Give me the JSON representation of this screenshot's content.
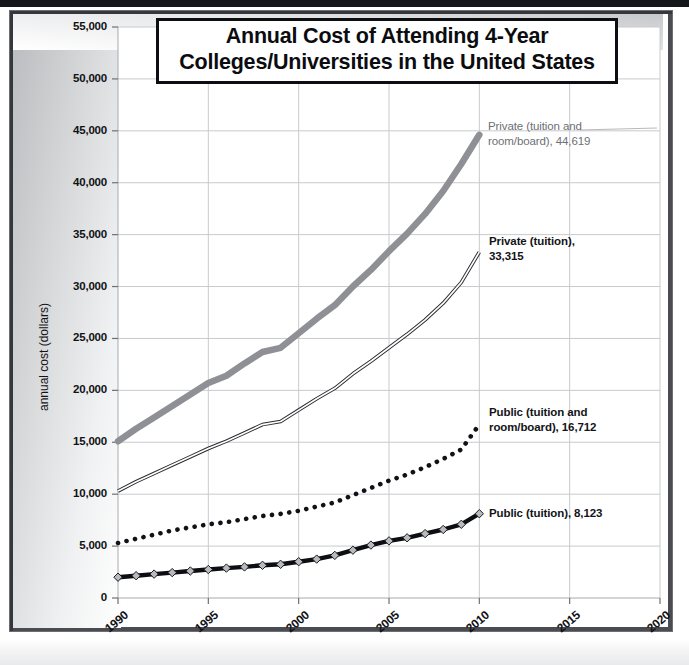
{
  "chart_data": {
    "type": "line",
    "title": "Annual Cost of Attending 4-Year Colleges/Universities in the United States",
    "title_lines": [
      "Annual Cost of Attending 4-Year",
      "Colleges/Universities in the United States"
    ],
    "xlabel": "",
    "ylabel": "annual cost (dollars)",
    "xlim": [
      1990,
      2020
    ],
    "ylim": [
      0,
      55000
    ],
    "xticks": [
      1990,
      1995,
      2000,
      2005,
      2010,
      2015,
      2020
    ],
    "xtick_labels": [
      "1990",
      "1995",
      "2000",
      "2005",
      "2010",
      "2015",
      "2020"
    ],
    "yticks": [
      0,
      5000,
      10000,
      15000,
      20000,
      25000,
      30000,
      35000,
      40000,
      45000,
      50000,
      55000
    ],
    "ytick_labels": [
      "0",
      "5,000",
      "10,000",
      "15,000",
      "20,000",
      "25,000",
      "30,000",
      "35,000",
      "40,000",
      "45,000",
      "50,000",
      "55,000"
    ],
    "grid": true,
    "legend_position": "inline-annotations",
    "x": [
      1990,
      1991,
      1992,
      1993,
      1994,
      1995,
      1996,
      1997,
      1998,
      1999,
      2000,
      2001,
      2002,
      2003,
      2004,
      2005,
      2006,
      2007,
      2008,
      2009,
      2010
    ],
    "series": [
      {
        "name": "Private (tuition and room/board)",
        "style": "thick-gray-line",
        "color": "#8e9095",
        "end_label": "Private (tuition and\nroom/board), 44,619",
        "end_value": 44619,
        "values": [
          15100,
          16300,
          17400,
          18500,
          19600,
          20700,
          21400,
          22600,
          23700,
          24100,
          25500,
          26900,
          28200,
          30000,
          31600,
          33400,
          35100,
          37000,
          39200,
          41800,
          44619
        ]
      },
      {
        "name": "Private (tuition)",
        "style": "thin-double-line",
        "color": "#2b2c30",
        "end_label": "Private (tuition),\n     33,315",
        "end_value": 33315,
        "values": [
          10300,
          11200,
          12000,
          12800,
          13600,
          14400,
          15100,
          15900,
          16700,
          17000,
          18100,
          19200,
          20200,
          21600,
          22800,
          24100,
          25400,
          26800,
          28400,
          30400,
          33315
        ]
      },
      {
        "name": "Public (tuition and room/board)",
        "style": "dotted-line",
        "color": "#111215",
        "end_label": "Public (tuition and\nroom/board), 16,712",
        "end_value": 16712,
        "values": [
          5300,
          5700,
          6100,
          6500,
          6800,
          7100,
          7300,
          7600,
          7900,
          8100,
          8400,
          8800,
          9200,
          9900,
          10600,
          11300,
          11900,
          12600,
          13400,
          14300,
          16712
        ]
      },
      {
        "name": "Public (tuition)",
        "style": "black-line-diamond-markers",
        "color": "#0d0e11",
        "marker": "diamond",
        "end_label": "Public (tuition), 8,123",
        "end_value": 8123,
        "values": [
          2000,
          2150,
          2300,
          2450,
          2600,
          2750,
          2880,
          3000,
          3150,
          3250,
          3500,
          3750,
          4100,
          4600,
          5100,
          5500,
          5800,
          6200,
          6600,
          7100,
          8123
        ]
      }
    ]
  },
  "annotations": [
    {
      "id": "annot-private-room-board",
      "text": "Private (tuition and\nroom/board), 44,619"
    },
    {
      "id": "annot-private-tuition",
      "text": "Private (tuition),\n     33,315"
    },
    {
      "id": "annot-public-room-board",
      "text": "Public (tuition and\nroom/board), 16,712"
    },
    {
      "id": "annot-public-tuition",
      "text": "Public (tuition), 8,123"
    }
  ],
  "colors": {
    "private_room_board": "#8e9095",
    "private_tuition": "#2b2c30",
    "public_room_board": "#111215",
    "public_tuition": "#0d0e11",
    "grid": "#c9cace",
    "axis": "#9a9ba0",
    "title_border": "#0d0e11"
  }
}
